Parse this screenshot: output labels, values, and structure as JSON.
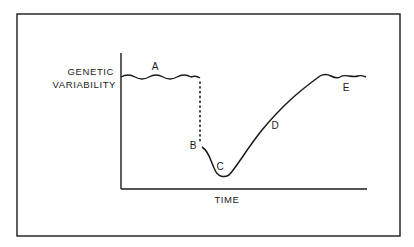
{
  "diagram": {
    "y_axis_label_line1": "GENETIC",
    "y_axis_label_line2": "VARIABILITY",
    "x_axis_label": "TIME",
    "points": {
      "A": "A",
      "B": "B",
      "C": "C",
      "D": "D",
      "E": "E"
    },
    "colors": {
      "ink": "#1a1a1a",
      "background": "#ffffff"
    }
  }
}
